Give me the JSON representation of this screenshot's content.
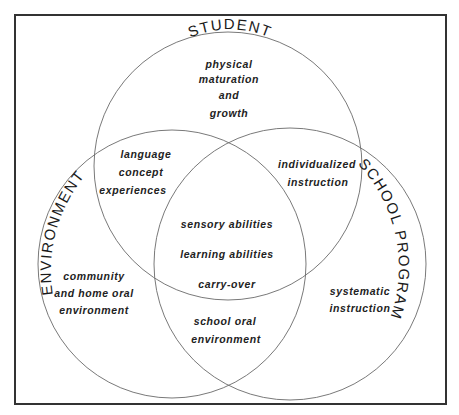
{
  "diagram": {
    "type": "venn",
    "sets": {
      "student": {
        "label": "STUDENT"
      },
      "environment": {
        "label": "ENVIRONMENT"
      },
      "school": {
        "label": "SCHOOL PROGRAM"
      }
    },
    "regions": {
      "student_only": [
        "physical",
        "maturation",
        "and",
        "growth"
      ],
      "student_environment": [
        "language",
        "concept",
        "experiences"
      ],
      "student_school": [
        "individualized",
        "instruction"
      ],
      "all_three": [
        "sensory abilities",
        "learning abilities",
        "carry-over"
      ],
      "environment_only": [
        "community",
        "and home oral",
        "environment"
      ],
      "environment_school": [
        "school oral",
        "environment"
      ],
      "school_only": [
        "systematic",
        "instruction"
      ]
    },
    "colors": {
      "frame": "#333333",
      "circle_stroke": "#6a6a6a",
      "text": "#222222",
      "background": "#ffffff"
    }
  }
}
